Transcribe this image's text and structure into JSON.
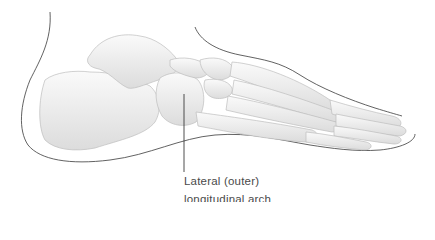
{
  "figure": {
    "label": {
      "line1": "Lateral (outer)",
      "line2": "longitudinal arch"
    },
    "colors": {
      "outline": "#3a3a3a",
      "bone_fill": "#f2f2f2",
      "bone_shade": "#d6d6d6",
      "bone_edge": "#bdbdbd",
      "label_text": "#4a4a4a",
      "leader_line": "#3a3a3a"
    }
  }
}
